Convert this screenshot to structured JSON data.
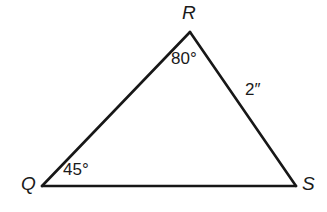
{
  "figure": {
    "kind": "triangle-diagram",
    "background_color": "#ffffff",
    "stroke_color": "#171717",
    "stroke_width": 2.6,
    "vertices": [
      {
        "name": "Q",
        "label": "Q",
        "x": 42,
        "y": 186
      },
      {
        "name": "R",
        "label": "R",
        "x": 190,
        "y": 32
      },
      {
        "name": "S",
        "label": "S",
        "x": 296,
        "y": 186
      }
    ],
    "edges": [
      {
        "name": "QR",
        "from": "Q",
        "to": "R"
      },
      {
        "name": "RS",
        "from": "R",
        "to": "S"
      },
      {
        "name": "QS",
        "from": "Q",
        "to": "S"
      }
    ],
    "angles": [
      {
        "at": "R",
        "label": "80°",
        "value": 80,
        "unit": "degrees"
      },
      {
        "at": "Q",
        "label": "45°",
        "value": 45,
        "unit": "degrees"
      }
    ],
    "sides": [
      {
        "edge": "RS",
        "label": "2″",
        "value": 2,
        "unit": "inches"
      }
    ]
  }
}
